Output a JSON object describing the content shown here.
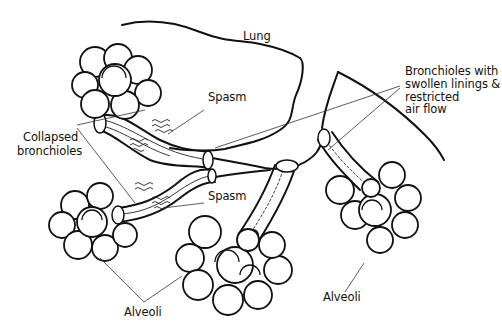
{
  "diagram": {
    "labels": {
      "lung": "Lung",
      "spasm_top": "Spasm",
      "spasm_bottom": "Spasm",
      "collapsed_line1": "Collapsed",
      "collapsed_line2": "bronchioles",
      "swollen_line1": "Bronchioles with",
      "swollen_line2": "swollen linings &",
      "swollen_line3": "restricted",
      "swollen_line4": "air flow",
      "alveoli_left": "Alveoli",
      "alveoli_right": "Alveoli"
    },
    "colors": {
      "ink": "#111111",
      "background": "#ffffff"
    }
  }
}
